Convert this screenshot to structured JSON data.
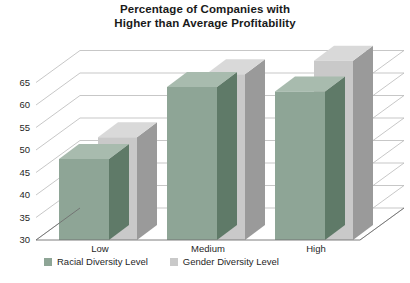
{
  "chart_data": {
    "type": "bar",
    "title": "Percentage of Companies with Higher than Average Profitability",
    "title_lines": [
      "Percentage of Companies with",
      "Higher than Average Profitability"
    ],
    "xlabel": "",
    "ylabel": "",
    "categories": [
      "Low",
      "Medium",
      "High"
    ],
    "series": [
      {
        "name": "Racial Diversity Level",
        "color": "#8ea596",
        "values": [
          48,
          64,
          63
        ]
      },
      {
        "name": "Gender Diversity Level",
        "color": "#c9c9c9",
        "values": [
          51,
          65,
          68
        ]
      }
    ],
    "ylim": [
      30,
      70
    ],
    "ytick_labels": [
      "30",
      "35",
      "40",
      "45",
      "50",
      "55",
      "60",
      "65"
    ],
    "ytick_values": [
      30,
      35,
      40,
      45,
      50,
      55,
      60,
      65
    ],
    "grid": true,
    "three_d": true,
    "legend_position": "bottom"
  },
  "legend": {
    "entries": [
      {
        "label": "Racial Diversity Level",
        "color": "#8ea596"
      },
      {
        "label": "Gender Diversity Level",
        "color": "#c9c9c9"
      }
    ]
  },
  "colors": {
    "racial_front": "#8ea596",
    "racial_top": "#a8bbae",
    "racial_side": "#5f7a68",
    "gender_front": "#c9c9c9",
    "gender_top": "#d9d9d9",
    "gender_side": "#9a9a9a",
    "grid": "#b9b9b9",
    "axis": "#6f6f6f",
    "text": "#1a1a1a"
  }
}
